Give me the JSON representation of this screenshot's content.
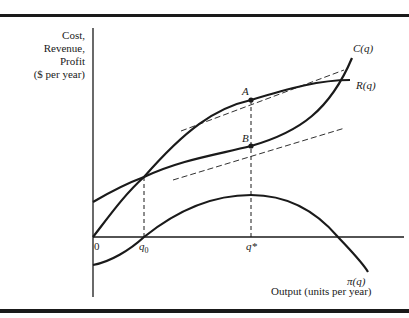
{
  "diagram": {
    "y_axis_label": [
      "Cost,",
      "Revenue,",
      "Profit",
      "($ per year)"
    ],
    "x_axis_label": "Output (units per year)",
    "origin_label": "0",
    "ticks": {
      "q0": "q",
      "q0_sub": "0",
      "qstar": "q*"
    },
    "curves": {
      "cost": "C(q)",
      "revenue": "R(q)",
      "profit": "π(q)"
    },
    "points": {
      "A": "A",
      "B": "B"
    }
  }
}
